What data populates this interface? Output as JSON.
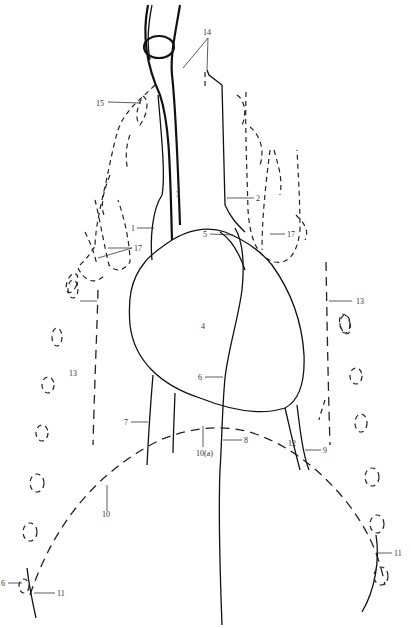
{
  "diagram": {
    "type": "anatomical line drawing",
    "labels": [
      {
        "id": "l1",
        "text": "1",
        "x": 131,
        "y": 231
      },
      {
        "id": "l2",
        "text": "2",
        "x": 257,
        "y": 200
      },
      {
        "id": "l3",
        "text": "3",
        "x": 177,
        "y": 198
      },
      {
        "id": "l4",
        "text": "4",
        "x": 203,
        "y": 328
      },
      {
        "id": "l5",
        "text": "5",
        "x": 213,
        "y": 236
      },
      {
        "id": "l6a",
        "text": "6",
        "x": 199,
        "y": 379
      },
      {
        "id": "l6b",
        "text": "6",
        "x": 0,
        "y": 586
      },
      {
        "id": "l7",
        "text": "7",
        "x": 125,
        "y": 424
      },
      {
        "id": "l8",
        "text": "8",
        "x": 244,
        "y": 442
      },
      {
        "id": "l9",
        "text": "9",
        "x": 323,
        "y": 452
      },
      {
        "id": "l10",
        "text": "10",
        "x": 103,
        "y": 514
      },
      {
        "id": "l10a",
        "text": "10(a)",
        "x": 197,
        "y": 452
      },
      {
        "id": "l11a",
        "text": "11",
        "x": 57,
        "y": 595
      },
      {
        "id": "l11b",
        "text": "11",
        "x": 394,
        "y": 555
      },
      {
        "id": "l12",
        "text": "12",
        "x": 288,
        "y": 445
      },
      {
        "id": "l13a",
        "text": "13",
        "x": 69,
        "y": 375
      },
      {
        "id": "l13b",
        "text": "13",
        "x": 356,
        "y": 303
      },
      {
        "id": "l14",
        "text": "14",
        "x": 203,
        "y": 35
      },
      {
        "id": "l15",
        "text": "15",
        "x": 98,
        "y": 105
      },
      {
        "id": "l17a",
        "text": "17",
        "x": 135,
        "y": 248
      },
      {
        "id": "l17b",
        "text": "17",
        "x": 287,
        "y": 234
      }
    ]
  }
}
